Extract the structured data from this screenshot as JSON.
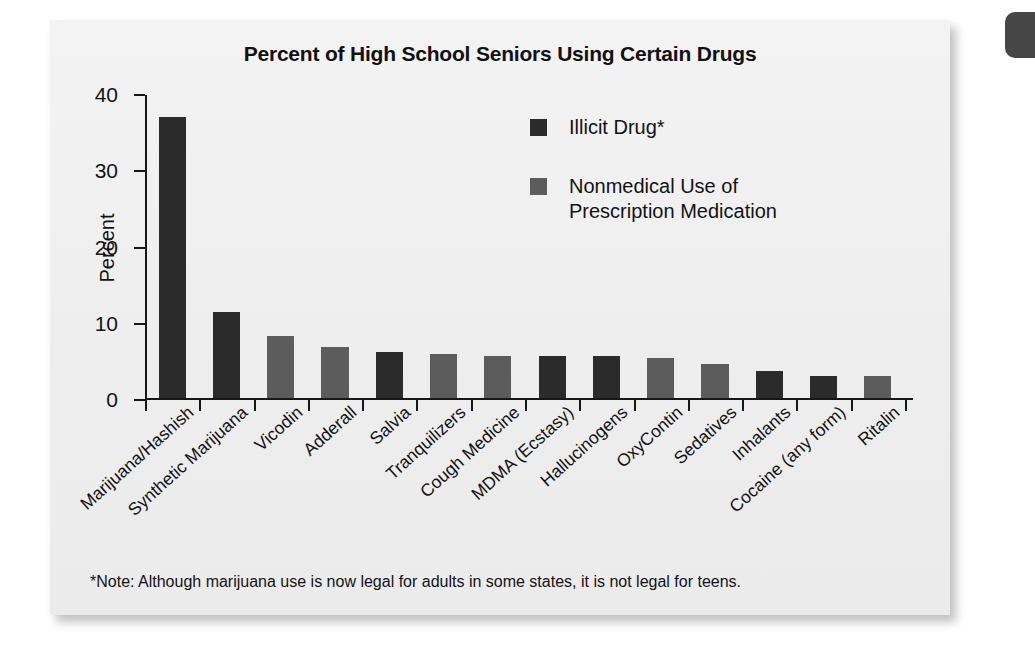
{
  "chart_data": {
    "type": "bar",
    "title": "Percent of High School Seniors Using Certain Drugs",
    "xlabel": "",
    "ylabel": "Percent",
    "ylim": [
      0,
      40
    ],
    "yticks": [
      0,
      10,
      20,
      30,
      40
    ],
    "grid": false,
    "legend_position": "inside-upper-right",
    "categories": [
      "Marijuana/Hashish",
      "Synthetic Marijuana",
      "Vicodin",
      "Adderall",
      "Salvia",
      "Tranquilizers",
      "Cough Medicine",
      "MDMA (Ecstasy)",
      "Hallucinogens",
      "OxyContin",
      "Sedatives",
      "Inhalants",
      "Cocaine (any form)",
      "Ritalin"
    ],
    "values": [
      36.8,
      11.3,
      8.1,
      6.7,
      6.1,
      5.8,
      5.5,
      5.5,
      5.5,
      5.2,
      4.5,
      3.5,
      2.9,
      2.9
    ],
    "series_of": [
      "illicit",
      "illicit",
      "prescription",
      "prescription",
      "illicit",
      "prescription",
      "prescription",
      "illicit",
      "illicit",
      "prescription",
      "prescription",
      "illicit",
      "illicit",
      "prescription"
    ],
    "series": [
      {
        "key": "illicit",
        "name": "Illicit Drug*",
        "color": "#2b2b2b"
      },
      {
        "key": "prescription",
        "name": "Nonmedical Use of\nPrescription Medication",
        "color": "#5c5c5c"
      }
    ],
    "note": "*Note: Although marijuana use is now legal for adults in some states, it is not legal for teens."
  },
  "legend": {
    "items": [
      {
        "label": "Illicit Drug*",
        "color": "#2b2b2b"
      },
      {
        "label_line1": "Nonmedical Use of",
        "label_line2": "Prescription Medication",
        "color": "#5c5c5c"
      }
    ]
  },
  "colors": {
    "illicit": "#2b2b2b",
    "prescription": "#5c5c5c",
    "axis": "#171717",
    "card_background": "#f0f0f0",
    "text": "#131313"
  }
}
